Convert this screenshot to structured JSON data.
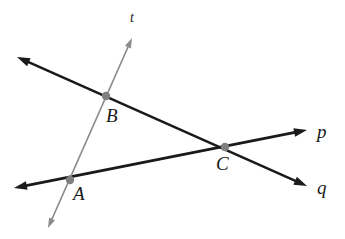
{
  "figure": {
    "type": "geometry-diagram",
    "background_color": "#ffffff",
    "canvas": {
      "width": 345,
      "height": 239
    }
  },
  "colors": {
    "line_black": "#1a1a1a",
    "line_gray": "#8c8c8c",
    "point_dot": "#808080",
    "label_text": "#1a1a1a",
    "background": "#ffffff"
  },
  "lines": [
    {
      "id": "line-p",
      "label": "p",
      "color": "#1a1a1a",
      "stroke_width": 2.6,
      "arrows": "both",
      "from": {
        "x": 14,
        "y": 188
      },
      "to": {
        "x": 307,
        "y": 130
      },
      "label_position": {
        "x": 317,
        "y": 122
      },
      "passes_through": [
        "A",
        "C"
      ]
    },
    {
      "id": "line-q",
      "label": "q",
      "color": "#1a1a1a",
      "stroke_width": 2.6,
      "arrows": "both",
      "from": {
        "x": 17,
        "y": 57
      },
      "to": {
        "x": 307,
        "y": 186
      },
      "label_position": {
        "x": 317,
        "y": 178
      },
      "passes_through": [
        "B",
        "C"
      ]
    },
    {
      "id": "line-t",
      "label": "t",
      "color": "#8c8c8c",
      "stroke_width": 1.7,
      "arrows": "both",
      "from": {
        "x": 132,
        "y": 38
      },
      "to": {
        "x": 48,
        "y": 228
      },
      "label_position": {
        "x": 130,
        "y": 11
      },
      "passes_through": [
        "B",
        "A"
      ]
    }
  ],
  "points": [
    {
      "id": "A",
      "label": "A",
      "x": 70,
      "y": 180,
      "radius": 4.2,
      "color": "#808080",
      "label_position": {
        "x": 73,
        "y": 184
      },
      "intersection_of": [
        "line-p",
        "line-t"
      ]
    },
    {
      "id": "B",
      "label": "B",
      "x": 106,
      "y": 96,
      "radius": 4.2,
      "color": "#808080",
      "label_position": {
        "x": 106,
        "y": 106
      },
      "intersection_of": [
        "line-q",
        "line-t"
      ]
    },
    {
      "id": "C",
      "label": "C",
      "x": 225,
      "y": 147,
      "radius": 4.2,
      "color": "#808080",
      "label_position": {
        "x": 216,
        "y": 154
      },
      "intersection_of": [
        "line-p",
        "line-q"
      ]
    }
  ]
}
